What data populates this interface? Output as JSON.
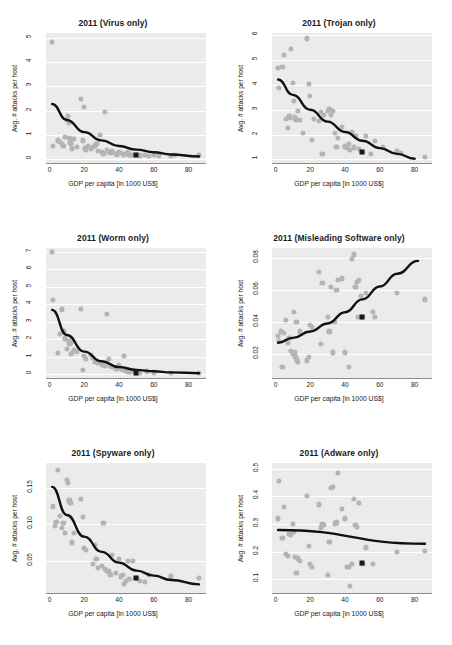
{
  "figure": {
    "xlabel": "GDP per capita [in 1000 US$]",
    "ylabel": "Avg. # attacks per host",
    "xticks": [
      "0",
      "20",
      "40",
      "60",
      "80"
    ],
    "point_color": "#b4b4b4",
    "curve_color": "#111111",
    "highlight_color": "#1a1a1a",
    "panel_bg": "#ebebeb",
    "grid_color": "#ffffff"
  },
  "chart_data": [
    {
      "type": "scatter",
      "title": "2011 (Virus only)",
      "xlabel": "GDP per capita [in 1000 US$]",
      "ylabel": "Avg. # attacks per host",
      "xlim": [
        -2,
        90
      ],
      "ylim": [
        -0.15,
        5.2
      ],
      "xticks": [
        0,
        20,
        40,
        60,
        80
      ],
      "yticks": [
        0,
        1,
        2,
        3,
        4,
        5
      ],
      "ytick_labels": [
        "0",
        "1",
        "2",
        "3",
        "4",
        "5"
      ],
      "grid": true,
      "legend": "none",
      "x": [
        1.5,
        2,
        5,
        6,
        7,
        8,
        9,
        10,
        10.5,
        11,
        11.5,
        12,
        12.5,
        13,
        14,
        16,
        18,
        19,
        20,
        20.5,
        21,
        22,
        24,
        25,
        26,
        27,
        28,
        29,
        30,
        31,
        32,
        33,
        34,
        35,
        36,
        37,
        38,
        39,
        40,
        41,
        42,
        43,
        44,
        45,
        46,
        47,
        48,
        50,
        52,
        55,
        57,
        60,
        63,
        70,
        72,
        86
      ],
      "y": [
        4.85,
        0.55,
        0.78,
        0.72,
        0.62,
        0.55,
        0.92,
        1.62,
        1.8,
        1.5,
        0.88,
        0.7,
        0.62,
        0.45,
        0.85,
        0.5,
        2.5,
        0.78,
        2.15,
        0.45,
        0.38,
        0.55,
        0.42,
        0.5,
        0.55,
        0.62,
        0.35,
        1.02,
        0.3,
        0.22,
        1.95,
        0.4,
        0.32,
        0.28,
        0.35,
        0.25,
        0.22,
        0.2,
        0.3,
        0.26,
        0.24,
        0.2,
        0.22,
        0.3,
        0.18,
        0.2,
        0.17,
        0.18,
        0.16,
        0.2,
        0.15,
        0.18,
        0.16,
        0.15,
        0.2,
        0.18
      ],
      "highlight_point": {
        "x": 50,
        "y": 0.18,
        "marker": "black-square"
      },
      "trend": {
        "kind": "exponential-decay",
        "points": [
          [
            1.5,
            2.28
          ],
          [
            10,
            1.62
          ],
          [
            20,
            1.12
          ],
          [
            30,
            0.78
          ],
          [
            40,
            0.55
          ],
          [
            50,
            0.4
          ],
          [
            60,
            0.29
          ],
          [
            70,
            0.2
          ],
          [
            86,
            0.12
          ]
        ]
      }
    },
    {
      "type": "scatter",
      "title": "2011 (Trojan only)",
      "xlabel": "GDP per capita [in 1000 US$]",
      "ylabel": "Avg. # attacks per host",
      "xlim": [
        -2,
        90
      ],
      "ylim": [
        0.85,
        6.1
      ],
      "xticks": [
        0,
        20,
        40,
        60,
        80
      ],
      "yticks": [
        1,
        2,
        3,
        4,
        5,
        6
      ],
      "ytick_labels": [
        "1",
        "2",
        "3",
        "4",
        "5",
        "6"
      ],
      "grid": true,
      "legend": "none",
      "x": [
        1.5,
        2,
        4,
        5,
        6,
        7,
        8,
        8.5,
        9,
        10,
        10.5,
        11,
        11.5,
        12,
        13,
        14,
        16,
        18,
        19,
        20,
        21,
        22,
        25,
        26,
        27,
        28,
        30,
        31,
        32,
        33,
        34,
        35,
        36,
        38,
        40,
        41,
        42,
        43,
        44,
        45,
        46,
        48,
        50,
        52,
        55,
        57,
        62,
        70,
        72,
        86
      ],
      "y": [
        4.7,
        3.88,
        4.72,
        5.22,
        2.62,
        2.28,
        2.75,
        2.68,
        5.45,
        4.08,
        3.35,
        2.72,
        2.62,
        2.58,
        2.95,
        2.6,
        2.05,
        5.88,
        4.05,
        3.55,
        1.78,
        2.62,
        2.55,
        2.9,
        1.22,
        2.78,
        2.95,
        3.05,
        2.78,
        2.95,
        2.05,
        1.5,
        1.85,
        2.3,
        1.52,
        1.45,
        1.62,
        1.38,
        2.1,
        1.48,
        1.95,
        1.42,
        1.3,
        1.95,
        1.22,
        1.75,
        1.5,
        1.32,
        1.25,
        1.1
      ],
      "highlight_point": {
        "x": 50,
        "y": 1.3,
        "marker": "black-square"
      },
      "trend": {
        "kind": "exponential-decay",
        "points": [
          [
            1.5,
            4.22
          ],
          [
            10,
            3.6
          ],
          [
            20,
            3.0
          ],
          [
            30,
            2.52
          ],
          [
            40,
            2.1
          ],
          [
            50,
            1.75
          ],
          [
            60,
            1.45
          ],
          [
            70,
            1.22
          ],
          [
            80,
            1.02
          ]
        ]
      }
    },
    {
      "type": "scatter",
      "title": "2011 (Worm only)",
      "xlabel": "GDP per capita [in 1000 US$]",
      "ylabel": "Avg. # attacks per host",
      "xlim": [
        -2,
        90
      ],
      "ylim": [
        -0.2,
        7.2
      ],
      "xticks": [
        0,
        20,
        40,
        60,
        80
      ],
      "yticks": [
        0,
        1,
        2,
        3,
        4,
        5,
        6,
        7
      ],
      "ytick_labels": [
        "0",
        "1",
        "2",
        "3",
        "4",
        "5",
        "6",
        "7"
      ],
      "grid": true,
      "legend": "none",
      "x": [
        1.5,
        2,
        5,
        6,
        7,
        8,
        9,
        10,
        11,
        11.5,
        12,
        12.5,
        13,
        14,
        16,
        18,
        19,
        20,
        21,
        24,
        25,
        26,
        28,
        30,
        31,
        32,
        33,
        34,
        35,
        36,
        38,
        39,
        40,
        41,
        42,
        43,
        44,
        45,
        46,
        48,
        50,
        52,
        56,
        60,
        70,
        86
      ],
      "y": [
        7.0,
        4.25,
        1.22,
        2.3,
        3.7,
        2.5,
        2.05,
        1.45,
        1.9,
        1.72,
        1.78,
        1.15,
        1.22,
        1.4,
        1.28,
        3.72,
        0.28,
        1.05,
        0.88,
        1.12,
        0.95,
        0.72,
        0.68,
        0.55,
        0.62,
        0.52,
        3.45,
        0.9,
        0.5,
        0.45,
        0.35,
        0.3,
        0.55,
        0.32,
        0.25,
        1.05,
        0.2,
        0.18,
        0.15,
        0.22,
        0.12,
        0.1,
        0.18,
        0.12,
        0.1,
        0.08
      ],
      "highlight_point": {
        "x": 50,
        "y": 0.08,
        "marker": "black-square"
      },
      "trend": {
        "kind": "exponential-decay",
        "points": [
          [
            1.5,
            3.68
          ],
          [
            10,
            2.25
          ],
          [
            20,
            1.3
          ],
          [
            30,
            0.75
          ],
          [
            40,
            0.42
          ],
          [
            50,
            0.26
          ],
          [
            60,
            0.18
          ],
          [
            70,
            0.12
          ],
          [
            86,
            0.07
          ]
        ]
      }
    },
    {
      "type": "scatter",
      "title": "2011 (Misleading Software only)",
      "xlabel": "GDP per capita [in 1000 US$]",
      "ylabel": "Avg. # attacks per host",
      "xlim": [
        -2,
        90
      ],
      "ylim": [
        0.005,
        0.086
      ],
      "xticks": [
        0,
        20,
        40,
        60,
        80
      ],
      "yticks": [
        0.02,
        0.04,
        0.06,
        0.08
      ],
      "ytick_labels": [
        "0.02",
        "0.04",
        "0.06",
        "0.08"
      ],
      "grid": true,
      "legend": "none",
      "x": [
        1.5,
        2,
        3,
        4,
        5,
        6,
        7,
        8,
        9,
        10,
        10.5,
        11,
        11.5,
        12,
        12.5,
        13,
        14,
        18,
        19,
        20,
        21,
        25,
        26,
        27,
        30,
        31,
        32,
        33,
        34,
        35,
        36,
        38,
        40,
        42,
        44,
        45,
        46,
        47,
        47.5,
        48,
        49,
        50,
        52,
        56,
        57,
        70,
        86
      ],
      "y": [
        0.031,
        0.028,
        0.034,
        0.012,
        0.033,
        0.041,
        0.027,
        0.03,
        0.022,
        0.02,
        0.046,
        0.021,
        0.018,
        0.04,
        0.016,
        0.015,
        0.034,
        0.016,
        0.018,
        0.038,
        0.037,
        0.071,
        0.026,
        0.064,
        0.043,
        0.034,
        0.062,
        0.021,
        0.04,
        0.06,
        0.066,
        0.067,
        0.021,
        0.012,
        0.079,
        0.082,
        0.062,
        0.065,
        0.043,
        0.066,
        0.056,
        0.043,
        0.058,
        0.046,
        0.043,
        0.058,
        0.054
      ],
      "highlight_point": {
        "x": 50,
        "y": 0.043,
        "marker": "black-square"
      },
      "trend": {
        "kind": "exponential-growth",
        "points": [
          [
            1.5,
            0.027
          ],
          [
            10,
            0.03
          ],
          [
            20,
            0.034
          ],
          [
            30,
            0.039
          ],
          [
            40,
            0.046
          ],
          [
            50,
            0.054
          ],
          [
            60,
            0.062
          ],
          [
            70,
            0.07
          ],
          [
            82,
            0.078
          ]
        ]
      }
    },
    {
      "type": "scatter",
      "title": "2011 (Spyware only)",
      "xlabel": "GDP per capita [in 1000 US$]",
      "ylabel": "Avg. # attacks per host",
      "xlim": [
        -2,
        90
      ],
      "ylim": [
        0.005,
        0.185
      ],
      "xticks": [
        0,
        20,
        40,
        60,
        80
      ],
      "yticks": [
        0.05,
        0.1,
        0.15
      ],
      "ytick_labels": [
        "0.05",
        "0.10",
        "0.15"
      ],
      "grid": true,
      "legend": "none",
      "x": [
        2,
        3,
        4,
        5,
        6,
        7,
        8,
        9,
        10,
        10.5,
        11,
        11.5,
        12,
        13,
        14,
        18,
        19,
        20,
        21,
        25,
        26,
        27,
        28,
        30,
        31,
        32,
        33,
        34,
        35,
        36,
        38,
        40,
        41,
        42,
        43,
        44,
        45,
        46,
        48,
        50,
        52,
        55,
        57,
        70,
        86
      ],
      "y": [
        0.125,
        0.098,
        0.104,
        0.175,
        0.112,
        0.095,
        0.102,
        0.088,
        0.162,
        0.158,
        0.132,
        0.134,
        0.13,
        0.075,
        0.088,
        0.135,
        0.11,
        0.068,
        0.065,
        0.045,
        0.072,
        0.052,
        0.04,
        0.042,
        0.102,
        0.038,
        0.036,
        0.035,
        0.03,
        0.058,
        0.033,
        0.052,
        0.028,
        0.03,
        0.018,
        0.022,
        0.05,
        0.024,
        0.05,
        0.026,
        0.022,
        0.02,
        0.03,
        0.028,
        0.026
      ],
      "highlight_point": {
        "x": 50,
        "y": 0.026,
        "marker": "black-square"
      },
      "trend": {
        "kind": "exponential-decay",
        "points": [
          [
            1.5,
            0.152
          ],
          [
            10,
            0.113
          ],
          [
            20,
            0.083
          ],
          [
            30,
            0.062
          ],
          [
            40,
            0.047
          ],
          [
            50,
            0.036
          ],
          [
            60,
            0.029
          ],
          [
            70,
            0.023
          ],
          [
            86,
            0.017
          ]
        ]
      }
    },
    {
      "type": "scatter",
      "title": "2011 (Adware only)",
      "xlabel": "GDP per capita [in 1000 US$]",
      "ylabel": "Avg. # attacks per host",
      "xlim": [
        -2,
        90
      ],
      "ylim": [
        0.05,
        0.52
      ],
      "xticks": [
        0,
        20,
        40,
        60,
        80
      ],
      "yticks": [
        0.1,
        0.2,
        0.3,
        0.4,
        0.5
      ],
      "ytick_labels": [
        "0.1",
        "0.2",
        "0.3",
        "0.4",
        "0.5"
      ],
      "grid": true,
      "legend": "none",
      "x": [
        1.5,
        2,
        4,
        5,
        6,
        7,
        8,
        9,
        10,
        10.5,
        11,
        12,
        13,
        14,
        18,
        19,
        20,
        21,
        25,
        26,
        27,
        28,
        30,
        31,
        32,
        33,
        34,
        35,
        36,
        38,
        40,
        41,
        42,
        43,
        44,
        45,
        46,
        47,
        48,
        50,
        52,
        56,
        70,
        86
      ],
      "y": [
        0.32,
        0.455,
        0.25,
        0.36,
        0.19,
        0.185,
        0.265,
        0.26,
        0.3,
        0.27,
        0.18,
        0.122,
        0.175,
        0.165,
        0.4,
        0.22,
        0.155,
        0.145,
        0.37,
        0.285,
        0.3,
        0.295,
        0.115,
        0.235,
        0.43,
        0.435,
        0.3,
        0.305,
        0.485,
        0.355,
        0.32,
        0.145,
        0.145,
        0.075,
        0.155,
        0.39,
        0.295,
        0.29,
        0.375,
        0.155,
        0.215,
        0.155,
        0.2,
        0.202
      ],
      "highlight_point": {
        "x": 50,
        "y": 0.158,
        "marker": "black-square"
      },
      "trend": {
        "kind": "linear",
        "points": [
          [
            1.5,
            0.278
          ],
          [
            86,
            0.228
          ]
        ]
      }
    }
  ]
}
